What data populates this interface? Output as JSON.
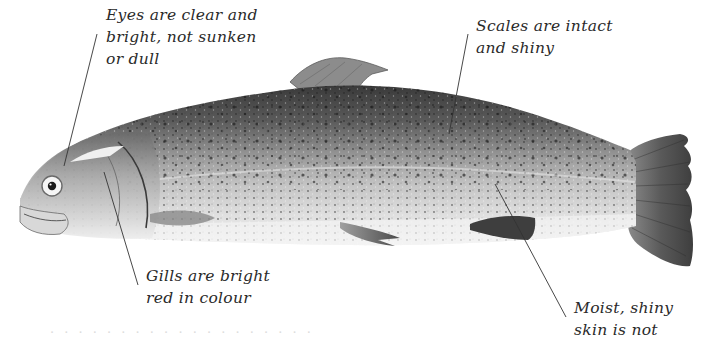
{
  "figure": {
    "background_color": "#ffffff",
    "text_color": "#2a2a2a",
    "leader_line_color": "#333333"
  },
  "labels": {
    "eyes": {
      "lines": [
        "Eyes are clear and",
        "bright, not sunken",
        "or dull"
      ]
    },
    "scales": {
      "lines": [
        "Scales are intact",
        "and shiny"
      ]
    },
    "gills": {
      "lines": [
        "Gills are bright",
        "red in colour"
      ]
    },
    "skin": {
      "lines": [
        "Moist, shiny",
        "skin is not"
      ]
    }
  },
  "faint_footer_text": "· · · · · · · · · · · · · · · · · · ·"
}
